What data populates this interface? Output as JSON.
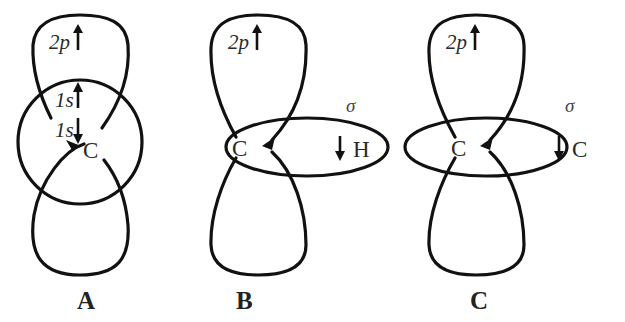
{
  "panels": {
    "a": {
      "label": "A",
      "top_lobe_text": "2p",
      "upper_1s_text": "1s",
      "lower_1s_text": "1s",
      "atom": "C"
    },
    "b": {
      "label": "B",
      "top_lobe_text": "2p",
      "sigma": "σ",
      "atom_left": "C",
      "atom_right": "H"
    },
    "c": {
      "label": "C",
      "top_lobe_text": "2p",
      "sigma": "σ",
      "atom_left": "C",
      "atom_right": "C"
    }
  },
  "colors": {
    "stroke": "#111111",
    "text": "#2a2a2a",
    "background": "#ffffff"
  }
}
